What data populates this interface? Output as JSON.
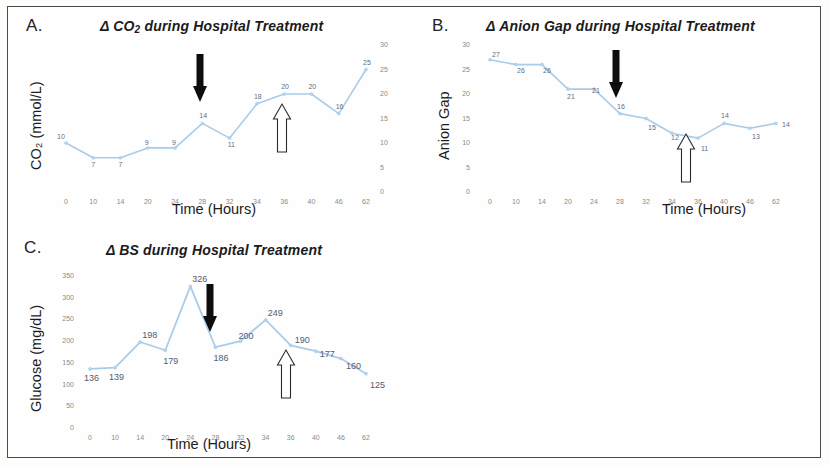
{
  "figure": {
    "panels": [
      "A.",
      "B.",
      "C."
    ]
  },
  "panelA": {
    "letter": "A.",
    "title_prefix": "Δ CO",
    "title_sub": "2",
    "title_suffix": " during Hospital Treatment",
    "title_plain": "Δ CO2 during Hospital Treatment",
    "xlabel": "Time (Hours)",
    "ylabel": "CO₂ (mmol/L)",
    "black_arrow_label": "black-down-arrow at 28 hours",
    "white_arrow_label": "white-up-arrow at 36 hours"
  },
  "panelB": {
    "letter": "B.",
    "title_plain": "Δ Anion Gap during Hospital Treatment",
    "xlabel": "Time (Hours)",
    "ylabel": "Anion Gap",
    "black_arrow_label": "black-down-arrow at 28 hours",
    "white_arrow_label": "white-up-arrow at 36 hours"
  },
  "panelC": {
    "letter": "C.",
    "title_plain": "Δ BS during Hospital Treatment",
    "xlabel": "Time (Hours)",
    "ylabel": "Glucose (mg/dL)",
    "black_arrow_label": "black-down-arrow at 28 hours",
    "white_arrow_label": "white-up-arrow at 36 hours"
  },
  "chart_data": [
    {
      "type": "line",
      "panel": "A",
      "title": "Δ CO2 during Hospital Treatment",
      "xlabel": "Time (Hours)",
      "ylabel": "CO2 (mmol/L)",
      "categories": [
        "0",
        "10",
        "14",
        "20",
        "24",
        "28",
        "32",
        "34",
        "36",
        "40",
        "46",
        "62"
      ],
      "values": [
        10,
        7,
        7,
        9,
        9,
        14,
        11,
        18,
        20,
        20,
        16,
        25
      ],
      "point_labels": [
        "10",
        "7",
        "7",
        "9",
        "9",
        "14",
        "11",
        "18",
        "20",
        "20",
        "16",
        "25"
      ],
      "yticks": [
        0,
        5,
        10,
        15,
        20,
        25,
        30
      ],
      "ytick_labels": [
        "0",
        "5",
        "10",
        "15",
        "20",
        "25",
        "30"
      ],
      "ylim": [
        0,
        30
      ],
      "y_axis_position": "right",
      "grid": false,
      "legend": "none",
      "annotations": [
        {
          "kind": "black-down-arrow",
          "at_category": "28"
        },
        {
          "kind": "white-up-arrow",
          "at_category": "36"
        }
      ]
    },
    {
      "type": "line",
      "panel": "B",
      "title": "Δ Anion Gap during Hospital Treatment",
      "xlabel": "Time (Hours)",
      "ylabel": "Anion Gap",
      "categories": [
        "0",
        "10",
        "14",
        "20",
        "24",
        "28",
        "32",
        "34",
        "36",
        "40",
        "46",
        "62"
      ],
      "values": [
        27,
        26,
        26,
        21,
        21,
        16,
        15,
        12,
        11,
        14,
        13,
        14
      ],
      "point_labels": [
        "27",
        "26",
        "26",
        "21",
        "21",
        "16",
        "15",
        "12",
        "11",
        "14",
        "13",
        "14"
      ],
      "yticks": [
        0,
        5,
        10,
        15,
        20,
        25,
        30
      ],
      "ytick_labels": [
        "0",
        "5",
        "10",
        "15",
        "20",
        "25",
        "30"
      ],
      "ylim": [
        0,
        30
      ],
      "y_axis_position": "left",
      "grid": false,
      "legend": "none",
      "annotations": [
        {
          "kind": "black-down-arrow",
          "at_category": "28"
        },
        {
          "kind": "white-up-arrow",
          "at_category": "36"
        }
      ]
    },
    {
      "type": "line",
      "panel": "C",
      "title": "Δ BS during Hospital Treatment",
      "xlabel": "Time (Hours)",
      "ylabel": "Glucose (mg/dL)",
      "categories": [
        "0",
        "10",
        "14",
        "20",
        "24",
        "28",
        "32",
        "34",
        "36",
        "40",
        "46",
        "62"
      ],
      "values": [
        136,
        139,
        198,
        179,
        326,
        186,
        200,
        249,
        190,
        177,
        160,
        125
      ],
      "point_labels": [
        "136",
        "139",
        "198",
        "179",
        "326",
        "186",
        "200",
        "249",
        "190",
        "177",
        "160",
        "125"
      ],
      "yticks": [
        0,
        50,
        100,
        150,
        200,
        250,
        300,
        350
      ],
      "ytick_labels": [
        "0",
        "50",
        "100",
        "150",
        "200",
        "250",
        "300",
        "350"
      ],
      "ylim": [
        0,
        350
      ],
      "y_axis_position": "left",
      "grid": false,
      "legend": "none",
      "annotations": [
        {
          "kind": "black-down-arrow",
          "at_category": "28"
        },
        {
          "kind": "white-up-arrow",
          "at_category": "36"
        }
      ]
    }
  ],
  "colors": {
    "line": "#a9cce8",
    "label_text": "#5f6f86",
    "tick_text": "#8a8a8a",
    "arrow_black": "#0d0d0d",
    "arrow_white": "#ffffff",
    "frame": "#4a4a4a"
  }
}
